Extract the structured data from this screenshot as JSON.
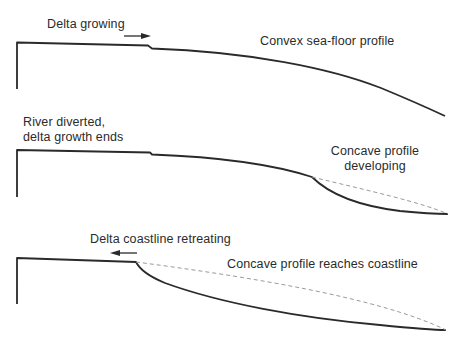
{
  "panel1": {
    "label_left": "Delta growing",
    "label_right": "Convex sea-floor profile"
  },
  "panel2": {
    "label_left_line1": "River diverted,",
    "label_left_line2": "delta growth ends",
    "label_right_line1": "Concave profile",
    "label_right_line2": "developing"
  },
  "panel3": {
    "label_left": "Delta coastline retreating",
    "label_right": "Concave profile reaches coastline"
  },
  "colors": {
    "line": "#2a2a2a",
    "dashed": "#9a9a9a",
    "background": "#ffffff"
  }
}
